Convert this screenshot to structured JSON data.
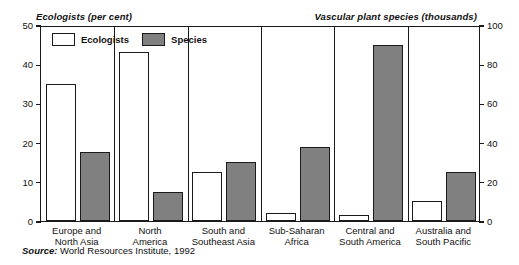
{
  "chart_data": {
    "type": "bar",
    "title": "",
    "categories": [
      "Europe and\nNorth Asia",
      "North\nAmerica",
      "South and\nSoutheast Asia",
      "Sub-Saharan\nAfrica",
      "Central and\nSouth America",
      "Australia and\nSouth Pacific"
    ],
    "category_lines": [
      [
        "Europe and",
        "North Asia"
      ],
      [
        "North",
        "America"
      ],
      [
        "South and",
        "Southeast Asia"
      ],
      [
        "Sub-Saharan",
        "Africa"
      ],
      [
        "Central and",
        "South America"
      ],
      [
        "Australia and",
        "South Pacific"
      ]
    ],
    "series": [
      {
        "name": "Ecologists",
        "axis": "left",
        "unit": "per cent",
        "color": "#ffffff",
        "values": [
          35,
          43,
          12.5,
          2,
          1.5,
          5
        ]
      },
      {
        "name": "Species",
        "axis": "right",
        "unit": "thousands",
        "color": "#808080",
        "values": [
          35,
          15,
          30,
          38,
          90,
          25
        ]
      }
    ],
    "left_axis": {
      "label": "Ecologists (per cent)",
      "ticks": [
        0,
        10,
        20,
        30,
        40,
        50
      ],
      "ylim": [
        0,
        50
      ]
    },
    "right_axis": {
      "label": "Vascular plant species (thousands)",
      "ticks": [
        0,
        20,
        40,
        60,
        80,
        100
      ],
      "ylim": [
        0,
        100
      ]
    },
    "legend": {
      "position": "top-left-inside",
      "entries": [
        {
          "label": "Ecologists",
          "swatch": "white"
        },
        {
          "label": "Species",
          "swatch": "gray"
        }
      ]
    },
    "grid": false,
    "source_prefix": "Source:",
    "source_text": "World Resources Institute, 1992"
  }
}
